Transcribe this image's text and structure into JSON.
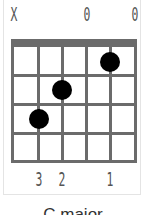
{
  "chord": {
    "name": "C major",
    "string_marks": [
      "X",
      "",
      "",
      "0",
      "",
      "0"
    ],
    "fingers": [
      "",
      "3",
      "2",
      "",
      "1",
      ""
    ],
    "dots": [
      {
        "string": 5,
        "fret": 1
      },
      {
        "string": 3,
        "fret": 2
      },
      {
        "string": 2,
        "fret": 3
      }
    ],
    "frets_shown": 4,
    "strings": 6
  },
  "colors": {
    "grid": "#6b6b6b",
    "dot": "#000000",
    "text": "#555555"
  }
}
